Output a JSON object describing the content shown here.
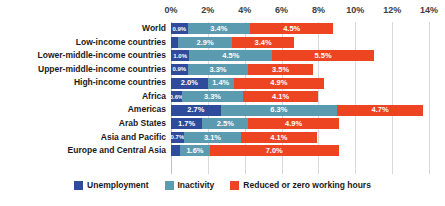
{
  "chart_data": {
    "type": "bar",
    "orientation": "horizontal",
    "stacked": true,
    "title": "",
    "subtitle": "",
    "xlabel": "",
    "ylabel": "",
    "xlim": [
      0,
      14
    ],
    "grid": true,
    "legend_position": "bottom",
    "xtick_labels": [
      "0%",
      "2%",
      "4%",
      "6%",
      "8%",
      "10%",
      "12%",
      "14%"
    ],
    "xtick_values": [
      0,
      2,
      4,
      6,
      8,
      10,
      12,
      14
    ],
    "categories": [
      "World",
      "Low-income countries",
      "Lower-middle-income countries",
      "Upper-middle-income countries",
      "High-income countries",
      "Africa",
      "Americas",
      "Arab States",
      "Asia and Pacific",
      "Europe and Central Asia"
    ],
    "series": [
      {
        "name": "Unemployment",
        "color": "#2E4C9B",
        "values": [
          0.9,
          0.4,
          1.0,
          0.9,
          2.0,
          0.6,
          2.7,
          1.7,
          0.7,
          0.5
        ],
        "labels": [
          "0.9%",
          "0.4%",
          "1.0%",
          "0.9%",
          "2.0%",
          "0.6%",
          "2.7%",
          "1.7%",
          "0.7%",
          "0.5%"
        ]
      },
      {
        "name": "Inactivity",
        "color": "#5B9BB0",
        "values": [
          3.4,
          2.9,
          4.5,
          3.3,
          1.4,
          3.3,
          6.3,
          2.5,
          3.1,
          1.6
        ],
        "labels": [
          "3.4%",
          "2.9%",
          "4.5%",
          "3.3%",
          "1.4%",
          "3.3%",
          "6.3%",
          "2.5%",
          "3.1%",
          "1.6%"
        ]
      },
      {
        "name": "Reduced or zero working hours",
        "color": "#ED4521",
        "values": [
          4.5,
          3.4,
          5.5,
          3.5,
          4.9,
          4.1,
          4.7,
          4.9,
          4.1,
          7.0
        ],
        "labels": [
          "4.5%",
          "3.4%",
          "5.5%",
          "3.5%",
          "4.9%",
          "4.1%",
          "4.7%",
          "4.9%",
          "4.1%",
          "7.0%"
        ]
      }
    ],
    "totals": [
      8.8,
      6.7,
      11.0,
      7.7,
      8.3,
      8.0,
      13.7,
      9.1,
      7.9,
      9.1
    ]
  },
  "legend": {
    "items": [
      {
        "label": "Unemployment",
        "color": "#2E4C9B"
      },
      {
        "label": "Inactivity",
        "color": "#5B9BB0"
      },
      {
        "label": "Reduced or zero working hours",
        "color": "#ED4521"
      }
    ]
  },
  "colors": {
    "unemployment": "#2E4C9B",
    "inactivity": "#5B9BB0",
    "reduced_hours": "#ED4521",
    "gridline": "#d9d9d9",
    "text": "#1a1a1a",
    "background": "#ffffff"
  }
}
